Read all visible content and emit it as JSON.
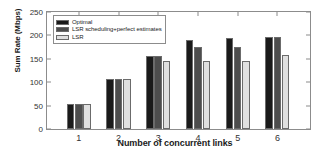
{
  "chart_data": {
    "type": "bar",
    "title": "",
    "xlabel": "Number of concurrent links",
    "ylabel": "Sum Rate (Mbps)",
    "categories": [
      "1",
      "2",
      "3",
      "4",
      "5",
      "6"
    ],
    "ylim": [
      0,
      250
    ],
    "yticks": [
      0,
      50,
      100,
      150,
      200,
      250
    ],
    "grid": false,
    "legend_position": "upper left",
    "series": [
      {
        "name": "Optimal",
        "color": "#1a1a1a",
        "values": [
          53,
          107,
          157,
          190,
          195,
          197
        ]
      },
      {
        "name": "LSR scheduling+perfect estimates",
        "color": "#4d4d4d",
        "values": [
          53,
          107,
          156,
          176,
          176,
          197
        ]
      },
      {
        "name": "LSR",
        "color": "#e0e0e0",
        "values": [
          54,
          107,
          146,
          146,
          146,
          158
        ]
      }
    ]
  },
  "axis": {
    "ytick_labels": [
      "0",
      "50",
      "100",
      "150",
      "200",
      "250"
    ],
    "xtick_labels": [
      "1",
      "2",
      "3",
      "4",
      "5",
      "6"
    ]
  }
}
